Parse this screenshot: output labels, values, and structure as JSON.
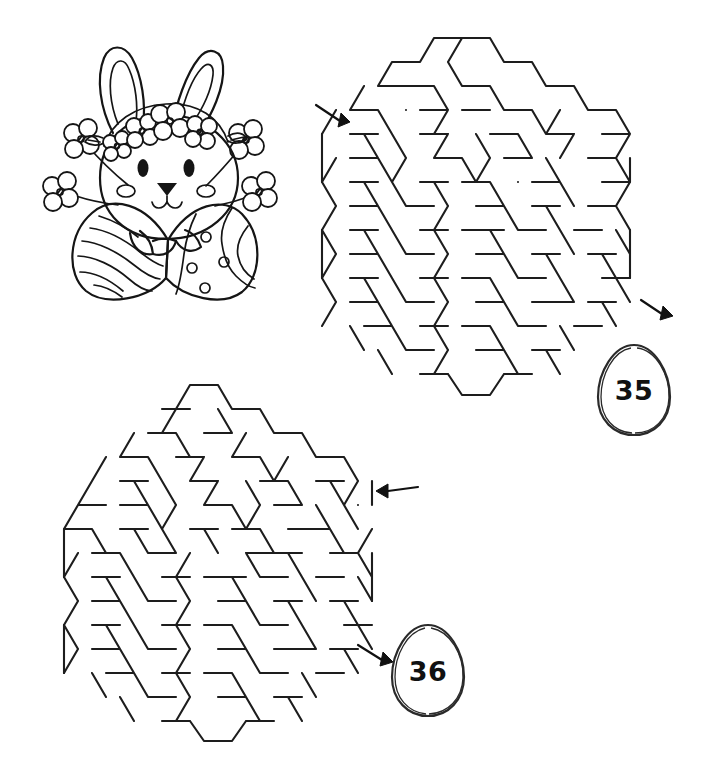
{
  "page": {
    "background_color": "#ffffff",
    "ink_color": "#1a1a1a",
    "width": 720,
    "height": 779
  },
  "illustration": {
    "name": "easter-bunny-with-eggs",
    "description": "Line-art bunny with flower crown holding two decorated Easter eggs, flowers on stems at each side",
    "style": "black-and-white coloring line art",
    "elements": [
      "bunny-ears",
      "flower-crown",
      "bunny-face",
      "bunny-eyes",
      "bunny-nose",
      "bunny-cheeks",
      "collar",
      "striped-egg",
      "dotted-wavy-egg",
      "flower-stems"
    ]
  },
  "mazes": [
    {
      "id": "maze-35",
      "label": "35",
      "type": "hexagonal honeycomb maze",
      "entry": {
        "side": "top-left",
        "arrow_direction": "down-right"
      },
      "exit": {
        "side": "right",
        "arrow_direction": "down-right"
      },
      "badge_shape": "egg"
    },
    {
      "id": "maze-36",
      "label": "36",
      "type": "hexagonal honeycomb maze",
      "entry": {
        "side": "right",
        "arrow_direction": "left"
      },
      "exit": {
        "side": "bottom-right",
        "arrow_direction": "down-right"
      },
      "badge_shape": "egg"
    }
  ],
  "badges": {
    "first": "35",
    "second": "36"
  }
}
